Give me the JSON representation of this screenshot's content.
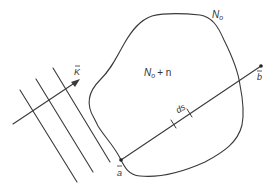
{
  "diagram": {
    "colors": {
      "ink": "#3a3a3a",
      "text": "#333333",
      "background": "#ffffff"
    },
    "labels": {
      "outside_region": "N",
      "outside_region_sub": "o",
      "inside_region": "N",
      "inside_region_sub": "o",
      "inside_region_suffix": "+ n",
      "wave_vector": "K",
      "point_a": "a",
      "point_b": "b",
      "path_element": "ds"
    },
    "elements": {
      "wavefront_lines": 3,
      "wave_vector_arrow": true,
      "region_boundary": "closed irregular curve",
      "path_segment": "straight line from a to b crossing region",
      "path_element_ticks": 2
    }
  }
}
